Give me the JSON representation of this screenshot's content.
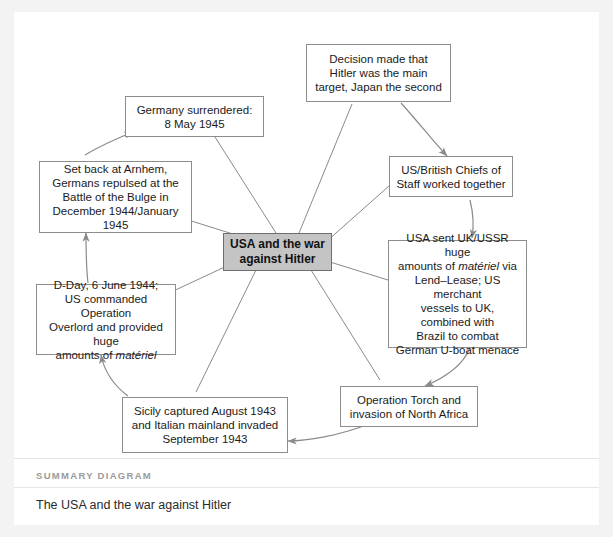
{
  "page": {
    "background_color": "#f3f3f3",
    "card_color": "#ffffff"
  },
  "diagram": {
    "type": "radial-concept-map",
    "center_fill": "#c4c4c4",
    "node_border_color": "#8d8d8d",
    "connector_color": "#8a8a8a",
    "center": {
      "id": "center",
      "label": "USA and the war against Hitler"
    },
    "nodes": [
      {
        "id": "decision",
        "lines": [
          "Decision made that",
          "Hitler was the main",
          "target, Japan the second"
        ]
      },
      {
        "id": "chiefs",
        "lines": [
          "US/British Chiefs of",
          "Staff worked together"
        ]
      },
      {
        "id": "lend-lease",
        "lines": [
          "USA sent UK/USSR huge",
          "amounts of |materiel| via",
          "Lend–Lease; US merchant",
          "vessels to UK, combined with",
          "Brazil to combat",
          "German U-boat menace"
        ],
        "italic_word": "matériel"
      },
      {
        "id": "torch",
        "lines": [
          "Operation Torch and",
          "invasion of North Africa"
        ]
      },
      {
        "id": "sicily",
        "lines": [
          "Sicily captured August 1943",
          "and Italian mainland invaded",
          "September 1943"
        ]
      },
      {
        "id": "dday",
        "lines": [
          "D-Day, 6 June 1944;",
          "US commanded Operation",
          "Overlord and provided huge",
          "amounts of |materiel|"
        ],
        "italic_word": "matériel"
      },
      {
        "id": "arnhem",
        "lines": [
          "Set back at Arnhem,",
          "Germans repulsed at the",
          "Battle of the Bulge in",
          "December 1944/January 1945"
        ]
      },
      {
        "id": "surrender",
        "lines": [
          "Germany surrendered:",
          "8 May 1945"
        ]
      }
    ],
    "sequence_arrows": [
      {
        "from": "decision",
        "to": "chiefs"
      },
      {
        "from": "chiefs",
        "to": "lend-lease"
      },
      {
        "from": "lend-lease",
        "to": "torch"
      },
      {
        "from": "torch",
        "to": "sicily"
      },
      {
        "from": "sicily",
        "to": "dday"
      },
      {
        "from": "dday",
        "to": "arnhem"
      },
      {
        "from": "arnhem",
        "to": "surrender"
      }
    ]
  },
  "footer": {
    "kicker": "SUMMARY DIAGRAM",
    "caption": "The USA and the war against Hitler"
  }
}
